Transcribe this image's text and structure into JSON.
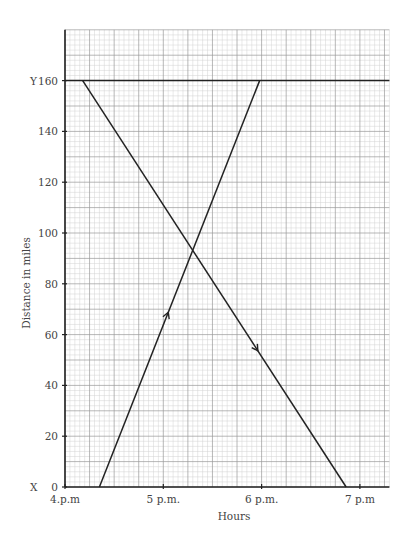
{
  "chart_data": {
    "type": "line",
    "title": "",
    "xlabel": "Hours",
    "ylabel": "Distance in miles",
    "x_tick_labels": [
      "4.p.m",
      "5 p.m.",
      "6 p.m.",
      "7 p.m"
    ],
    "x_ticks_hours": [
      4,
      5,
      6,
      7
    ],
    "y_tick_labels": [
      "0",
      "20",
      "40",
      "60",
      "80",
      "100",
      "120",
      "140",
      "160"
    ],
    "y_ticks": [
      0,
      20,
      40,
      60,
      80,
      100,
      120,
      140,
      160
    ],
    "xlim": [
      4,
      7.3
    ],
    "ylim": [
      0,
      180
    ],
    "grid": true,
    "point_labels": {
      "origin": "X",
      "top": "Y"
    },
    "reference_line": {
      "name": "Y line",
      "y": 160
    },
    "series": [
      {
        "name": "Journey from Y to X",
        "direction": "downward arrow",
        "points": [
          [
            4.18,
            160
          ],
          [
            6.86,
            0
          ]
        ]
      },
      {
        "name": "Journey from X to Y",
        "direction": "upward arrow",
        "points": [
          [
            4.35,
            0
          ],
          [
            5.98,
            160
          ]
        ]
      }
    ]
  }
}
